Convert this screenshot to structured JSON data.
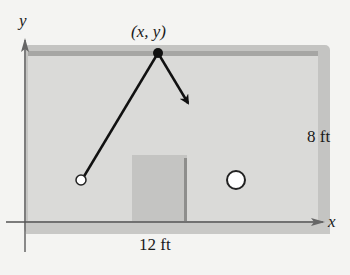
{
  "diagram": {
    "axes": {
      "x_label": "x",
      "y_label": "y"
    },
    "point_label": "(x, y)",
    "dimensions": {
      "width_label": "12 ft",
      "height_label": "8 ft"
    },
    "colors": {
      "background": "#f4f4f2",
      "table_fill": "#d8d8d6",
      "table_rail": "#b4b4b2",
      "top_rail_inner": "#a8a8a6",
      "obstacle_fill": "#c6c6c4",
      "obstacle_edge": "#8e8e8c",
      "path": "#111111",
      "axis": "#555555"
    },
    "elements": {
      "start_ball": "open circle at lower left",
      "target_ball": "open circle at lower right",
      "bounce_point": "filled dot on top edge",
      "obstacle": "rectangle near bottom center",
      "path": "line from start ball to bounce point, then arrow toward lower right"
    }
  }
}
